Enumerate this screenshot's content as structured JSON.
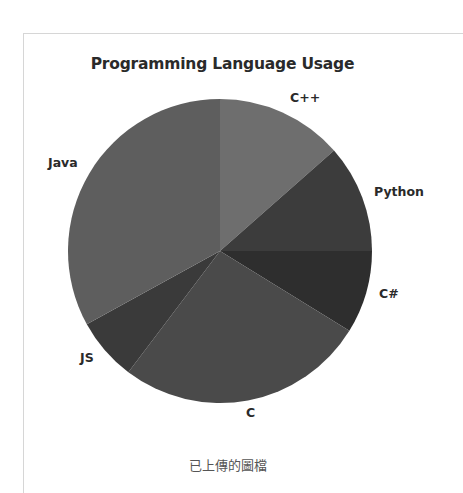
{
  "caption": "已上傳的圖檔",
  "chart_data": {
    "type": "pie",
    "title": "Programming Language Usage",
    "start_angle": "90 (12 o'clock), clockwise",
    "categories": [
      "C++",
      "Python",
      "C#",
      "C",
      "JS",
      "Java"
    ],
    "values": [
      13.5,
      11.5,
      8.8,
      26.5,
      6.7,
      33.0
    ],
    "unit": "percent (estimated from slice angles)",
    "colors": [
      "#6e6e6e",
      "#3c3c3c",
      "#2e2e2e",
      "#4a4a4a",
      "#3a3a3a",
      "#5e5e5e"
    ],
    "legend": "none (labels outside slices)"
  },
  "labels": {
    "cpp": "C++",
    "python": "Python",
    "csharp": "C#",
    "c": "C",
    "js": "JS",
    "java": "Java"
  }
}
